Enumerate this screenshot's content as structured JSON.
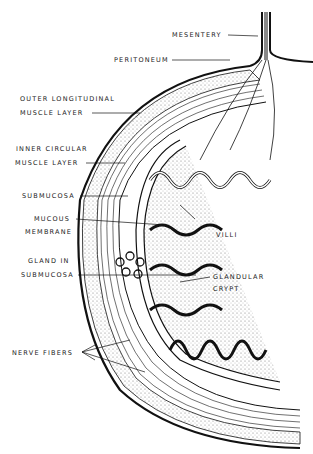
{
  "diagram": {
    "labels": {
      "mesentery": "MESENTERY",
      "peritoneum": "PERITONEUM",
      "outer_longitudinal_1": "OUTER LONGITUDINAL",
      "outer_longitudinal_2": "MUSCLE LAYER",
      "inner_circular_1": "INNER CIRCULAR",
      "inner_circular_2": "MUSCLE LAYER",
      "submucosa": "SUBMUCOSA",
      "mucous_1": "MUCOUS",
      "mucous_2": "MEMBRANE",
      "gland_1": "GLAND IN",
      "gland_2": "SUBMUCOSA",
      "villi": "VILLI",
      "glandular_1": "GLANDULAR",
      "glandular_2": "CRYPT",
      "nerve_fibers": "NERVE FIBERS"
    },
    "colors": {
      "ink": "#111111",
      "background": "#ffffff",
      "stipple": "#777777"
    }
  }
}
